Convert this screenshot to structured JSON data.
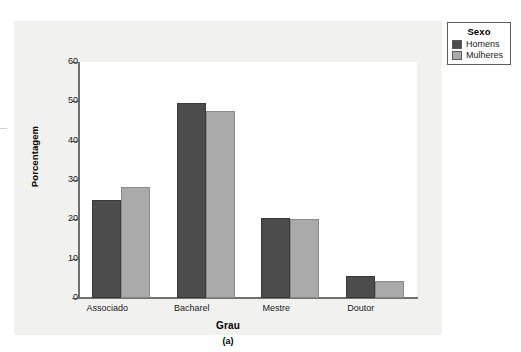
{
  "chart_data": {
    "type": "bar",
    "title": "",
    "subtitle": "",
    "caption": "(a)",
    "xlabel": "Grau",
    "ylabel": "Porcentagem",
    "categories": [
      "Associado",
      "Bacharel",
      "Mestre",
      "Doutor"
    ],
    "series": [
      {
        "name": "Homens",
        "color": "#4c4c4c",
        "values": [
          24.9,
          49.6,
          20.4,
          5.6
        ]
      },
      {
        "name": "Mulheres",
        "color": "#aaaaaa",
        "values": [
          28.1,
          47.6,
          20.2,
          4.4
        ]
      }
    ],
    "ylim": [
      0,
      60
    ],
    "yticks": [
      0,
      10,
      20,
      30,
      40,
      50,
      60
    ],
    "ytick_labels": [
      "0",
      "10",
      "20",
      "30",
      "40",
      "50",
      "60"
    ],
    "grid": false,
    "legend": {
      "title": "Sexo",
      "position": "outside-top-right",
      "entries": [
        "Homens",
        "Mulheres"
      ]
    }
  },
  "figure": {
    "panel_background": "#f1f1f0",
    "plot_background": "#ffffff",
    "axis_color": "#707070"
  }
}
